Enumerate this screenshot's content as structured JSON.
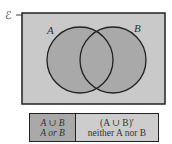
{
  "diagram": {
    "universal_label": "ℰ",
    "set_a_label": "A",
    "set_b_label": "B",
    "colors": {
      "universe_fill": "#c9c9c9",
      "circle_fill": "#a9a9a9",
      "stroke": "#222222"
    }
  },
  "legend": {
    "union": {
      "symbol": "A ∪ B",
      "words": "A or B"
    },
    "complement": {
      "symbol": "(A ∪ B)′",
      "words": "neither A nor B"
    }
  }
}
